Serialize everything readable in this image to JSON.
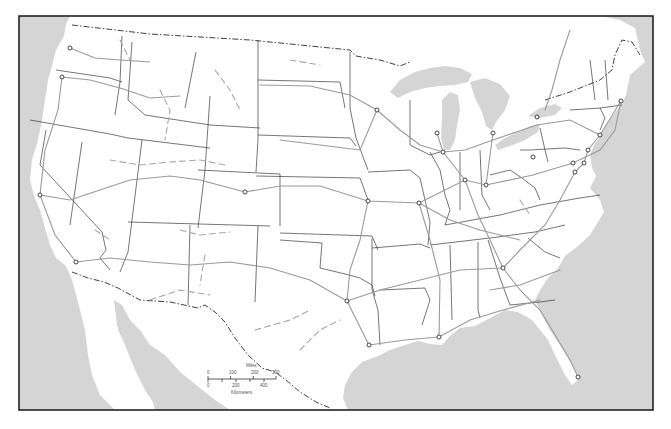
{
  "map": {
    "subject": "Contiguous United States",
    "colors": {
      "water": "#d5d5d5",
      "land": "#ffffff",
      "state_border": "#3a3a3a",
      "route": "#9a9a9a",
      "frame": "#222222"
    },
    "frame": {
      "x": 19,
      "y": 16,
      "width": 634,
      "height": 394
    },
    "cities": [
      {
        "name": "city-seattle",
        "x": 70,
        "y": 48
      },
      {
        "name": "city-portland",
        "x": 62,
        "y": 77
      },
      {
        "name": "city-san-francisco",
        "x": 40,
        "y": 195
      },
      {
        "name": "city-los-angeles",
        "x": 76,
        "y": 262
      },
      {
        "name": "city-denver",
        "x": 245,
        "y": 192
      },
      {
        "name": "city-minneapolis",
        "x": 377,
        "y": 110
      },
      {
        "name": "city-kansas-city",
        "x": 368,
        "y": 201
      },
      {
        "name": "city-st-louis",
        "x": 419,
        "y": 203
      },
      {
        "name": "city-milwaukee",
        "x": 437,
        "y": 133
      },
      {
        "name": "city-chicago",
        "x": 443,
        "y": 152
      },
      {
        "name": "city-detroit",
        "x": 493,
        "y": 133
      },
      {
        "name": "city-buffalo",
        "x": 537,
        "y": 117
      },
      {
        "name": "city-cleveland",
        "x": 533,
        "y": 157
      },
      {
        "name": "city-indianapolis",
        "x": 465,
        "y": 180
      },
      {
        "name": "city-cincinnati",
        "x": 486,
        "y": 185
      },
      {
        "name": "city-pittsburgh",
        "x": 573,
        "y": 163
      },
      {
        "name": "city-washington",
        "x": 575,
        "y": 172
      },
      {
        "name": "city-baltimore",
        "x": 584,
        "y": 163
      },
      {
        "name": "city-philadelphia",
        "x": 588,
        "y": 150
      },
      {
        "name": "city-new-york",
        "x": 600,
        "y": 135
      },
      {
        "name": "city-boston",
        "x": 621,
        "y": 101
      },
      {
        "name": "city-atlanta",
        "x": 503,
        "y": 268
      },
      {
        "name": "city-dallas",
        "x": 347,
        "y": 301
      },
      {
        "name": "city-houston",
        "x": 369,
        "y": 345
      },
      {
        "name": "city-new-orleans",
        "x": 439,
        "y": 337
      },
      {
        "name": "city-miami",
        "x": 578,
        "y": 377
      }
    ],
    "scale_bar": {
      "miles_label": "Miles",
      "miles_ticks": [
        "0",
        "100",
        "200",
        "300"
      ],
      "km_label": "Kilometers",
      "km_ticks": [
        "0",
        "200",
        "400"
      ]
    }
  }
}
